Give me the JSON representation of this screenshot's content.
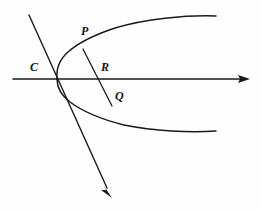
{
  "figure": {
    "background_color": "#fefefe",
    "stroke_color": "#1a1a1a",
    "width": 261,
    "height": 211,
    "labels": {
      "C": "C",
      "P": "P",
      "R": "R",
      "Q": "Q"
    },
    "label_positions": {
      "C": [
        34,
        68
      ],
      "P": [
        85,
        32
      ],
      "R": [
        105,
        68
      ],
      "Q": [
        118,
        97
      ]
    },
    "elements": {
      "axis_name": "horizontal-axis",
      "axis_start": [
        13,
        79
      ],
      "axis_end": [
        250,
        79
      ],
      "axis_arrow": "right",
      "transversal_name": "transversal-line",
      "transversal_start": [
        29,
        15
      ],
      "transversal_end": [
        112,
        197
      ],
      "transversal_arrow": "down-right",
      "curve_name": "parabola",
      "curve_vertex": [
        56,
        78
      ],
      "curve_upper_end": [
        216,
        16
      ],
      "curve_lower_end": [
        216,
        131
      ],
      "chord_name": "chord-PQ",
      "chord_start": [
        83,
        49
      ],
      "chord_end": [
        112,
        106
      ],
      "intersection_R": [
        105,
        79
      ],
      "intersection_C": [
        57,
        79
      ]
    }
  }
}
